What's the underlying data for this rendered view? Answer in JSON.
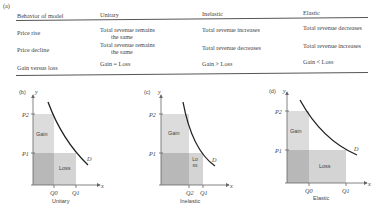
{
  "table": {
    "label": "(a)",
    "headers": [
      "Behavior of model",
      "Unitary",
      "Inelastic",
      "Elastic"
    ],
    "rows": [
      {
        "behavior": "Price rise",
        "unitary": [
          "Total revenue remains",
          "the same"
        ],
        "inelastic": "Total revenue increases",
        "elastic": "Total revenue decreases"
      },
      {
        "behavior": "Price decline",
        "unitary": [
          "Total revenue remains",
          "the same"
        ],
        "inelastic": "Total revenue decreases",
        "elastic": "Total revenue increases"
      },
      {
        "behavior": "Gain versus loss",
        "unitary": "Gain = Loss",
        "inelastic": "Gain > Loss",
        "elastic": "Gain < Loss"
      }
    ]
  },
  "panels": [
    {
      "label": "(b)",
      "title": "Unitary",
      "y_axis": "y",
      "x_axis": "x",
      "p_high": "P2",
      "p_low": "P1",
      "q_left": "Q0",
      "q_right": "Q1",
      "gain_label": "Gain",
      "loss_label": "Loss",
      "curve_label": "D"
    },
    {
      "label": "(c)",
      "title": "Inelastic",
      "y_axis": "y",
      "x_axis": "x",
      "p_high": "P2",
      "p_low": "P1",
      "q_left": "Q2",
      "q_right": "Q1",
      "gain_label": "Gain",
      "loss_label": "Loss",
      "curve_label": "D"
    },
    {
      "label": "(d)",
      "title": "Elastic",
      "y_axis": "y",
      "x_axis": "x",
      "p_high": "P2",
      "p_low": "P1",
      "q_left": "Q0",
      "q_right": "Q1",
      "gain_label": "Gain",
      "loss_label": "Loss",
      "curve_label": "D"
    }
  ],
  "colors": {
    "gain_fill": "#dcdcdc",
    "overlap_fill": "#b4b4b4",
    "loss_fill": "#d2d2d2",
    "curve": "#222222",
    "axis": "#666666"
  }
}
